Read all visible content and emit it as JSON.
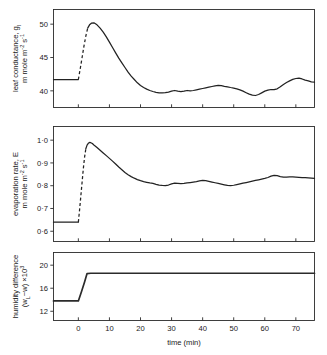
{
  "figure": {
    "xaxis": {
      "label_main": "time",
      "label_units": "(min)",
      "ticks": [
        "0",
        "10",
        "20",
        "30",
        "40",
        "50",
        "60",
        "70"
      ],
      "range": [
        -8,
        76
      ]
    },
    "panels": [
      {
        "name": "leaf-conductance",
        "ylabel_line1": "leaf conductance, g",
        "ylabel_line1_sub": "l",
        "ylabel_line2_a": "m mole m",
        "ylabel_line2_sup1": "-2",
        "ylabel_line2_b": " s",
        "ylabel_line2_sup2": "-1",
        "yticks": [
          "50",
          "45",
          "40"
        ]
      },
      {
        "name": "evaporation-rate",
        "ylabel_line1": "evaporation rate, E",
        "ylabel_line2_a": "m mole m",
        "ylabel_line2_sup1": "-2",
        "ylabel_line2_b": " s",
        "ylabel_line2_sup2": "-1",
        "yticks": [
          "1·0",
          "0·9",
          "0·8",
          "0·7",
          "0·6"
        ]
      },
      {
        "name": "humidity-difference",
        "ylabel_line1": "humidity difference",
        "ylabel_line2_a": "(w",
        "ylabel_line2_sub": "L",
        "ylabel_line2_b": "−w) ×10",
        "ylabel_line2_sup": "3",
        "yticks": [
          "20",
          "16",
          "12"
        ]
      }
    ]
  },
  "chart_data": [
    {
      "type": "line",
      "title": "",
      "name": "leaf conductance",
      "xlabel": "time (min)",
      "ylabel": "leaf conductance, g_l / m mole m^-2 s^-1",
      "xlim": [
        -8,
        76
      ],
      "ylim": [
        37.5,
        52.2
      ],
      "yticks": [
        40,
        45,
        50
      ],
      "xticks": [
        0,
        10,
        20,
        30,
        40,
        50,
        60,
        70
      ],
      "grid": false,
      "legend": null,
      "segments": [
        {
          "style": "solid",
          "x": [
            -8,
            -4,
            0
          ],
          "y": [
            41.7,
            41.7,
            41.7
          ]
        },
        {
          "style": "dashed",
          "x": [
            0,
            0.6,
            1.2,
            1.8,
            2.4,
            3.0
          ],
          "y": [
            41.7,
            43.3,
            45.0,
            46.7,
            48.2,
            49.4
          ]
        },
        {
          "style": "solid",
          "x": [
            3.0,
            3.6,
            4.2,
            5.0,
            6.0,
            7.0,
            8.0,
            9.0,
            10.0,
            11.0,
            12.0,
            13.0,
            14.0,
            15.0,
            16.0,
            17.0,
            18.0,
            19.0,
            20.0,
            21.0,
            22.0,
            23.0,
            24.0,
            25.0,
            26.0,
            27.0,
            28.0,
            29.0,
            30.0,
            31.0,
            32.0,
            33.0,
            34.0,
            35.0,
            36.0,
            37.0,
            38.0,
            39.0,
            40.0,
            41.0,
            42.0,
            43.0,
            44.0,
            45.0,
            46.0,
            47.0,
            48.0,
            49.0,
            50.0,
            51.0,
            52.0,
            53.0,
            54.0,
            55.0,
            56.0,
            57.0,
            58.0,
            59.0,
            60.0,
            61.0,
            62.0,
            63.0,
            64.0,
            65.0,
            66.0,
            67.0,
            68.0,
            69.0,
            70.0,
            71.0,
            72.0,
            73.0,
            74.0,
            75.0,
            76.0
          ],
          "y": [
            49.4,
            49.9,
            50.15,
            50.2,
            49.9,
            49.4,
            48.8,
            48.1,
            47.3,
            46.5,
            45.7,
            44.9,
            44.2,
            43.5,
            42.8,
            42.2,
            41.7,
            41.2,
            40.8,
            40.5,
            40.25,
            40.05,
            39.9,
            39.78,
            39.7,
            39.68,
            39.72,
            39.82,
            39.95,
            40.05,
            39.95,
            39.88,
            39.95,
            40.05,
            40.0,
            40.05,
            40.15,
            40.25,
            40.35,
            40.45,
            40.55,
            40.65,
            40.75,
            40.82,
            40.78,
            40.68,
            40.6,
            40.5,
            40.42,
            40.3,
            40.15,
            39.95,
            39.72,
            39.5,
            39.35,
            39.3,
            39.45,
            39.7,
            39.95,
            40.1,
            40.2,
            40.18,
            40.3,
            40.6,
            40.95,
            41.25,
            41.5,
            41.72,
            41.85,
            41.9,
            41.78,
            41.6,
            41.5,
            41.35,
            41.3
          ]
        }
      ]
    },
    {
      "type": "line",
      "title": "",
      "name": "evaporation rate",
      "xlabel": "time (min)",
      "ylabel": "evaporation rate, E / m mole m^-2 s^-1",
      "xlim": [
        -8,
        76
      ],
      "ylim": [
        0.555,
        1.06
      ],
      "yticks": [
        0.6,
        0.7,
        0.8,
        0.9,
        1.0
      ],
      "xticks": [
        0,
        10,
        20,
        30,
        40,
        50,
        60,
        70
      ],
      "grid": false,
      "legend": null,
      "segments": [
        {
          "style": "solid",
          "x": [
            -8,
            -4,
            0
          ],
          "y": [
            0.64,
            0.64,
            0.64
          ]
        },
        {
          "style": "dashed",
          "x": [
            0,
            0.4,
            0.8,
            1.2,
            1.6,
            2.0,
            2.4
          ],
          "y": [
            0.64,
            0.695,
            0.755,
            0.815,
            0.875,
            0.925,
            0.962
          ]
        },
        {
          "style": "solid",
          "x": [
            2.4,
            2.8,
            3.2,
            3.6,
            4.0,
            4.5,
            5.0,
            6.0,
            7.0,
            8.0,
            9.0,
            10.0,
            11.0,
            12.0,
            13.0,
            14.0,
            15.0,
            16.0,
            17.0,
            18.0,
            19.0,
            20.0,
            21.0,
            22.0,
            23.0,
            24.0,
            25.0,
            26.0,
            27.0,
            28.0,
            29.0,
            30.0,
            31.0,
            32.0,
            33.0,
            34.0,
            35.0,
            36.0,
            37.0,
            38.0,
            39.0,
            40.0,
            41.0,
            42.0,
            43.0,
            44.0,
            45.0,
            46.0,
            47.0,
            48.0,
            49.0,
            50.0,
            51.0,
            52.0,
            53.0,
            54.0,
            55.0,
            56.0,
            57.0,
            58.0,
            59.0,
            60.0,
            61.0,
            62.0,
            63.0,
            64.0,
            65.0,
            66.0,
            67.0,
            68.0,
            69.0,
            70.0,
            71.0,
            72.0,
            73.0,
            74.0,
            75.0,
            76.0
          ],
          "y": [
            0.962,
            0.978,
            0.986,
            0.99,
            0.989,
            0.985,
            0.979,
            0.968,
            0.956,
            0.944,
            0.932,
            0.92,
            0.908,
            0.895,
            0.882,
            0.87,
            0.858,
            0.848,
            0.84,
            0.833,
            0.827,
            0.822,
            0.818,
            0.815,
            0.812,
            0.81,
            0.806,
            0.803,
            0.801,
            0.8,
            0.803,
            0.808,
            0.811,
            0.81,
            0.809,
            0.81,
            0.812,
            0.814,
            0.816,
            0.818,
            0.821,
            0.823,
            0.822,
            0.819,
            0.816,
            0.813,
            0.81,
            0.807,
            0.804,
            0.801,
            0.8,
            0.802,
            0.805,
            0.808,
            0.811,
            0.814,
            0.817,
            0.82,
            0.823,
            0.826,
            0.829,
            0.832,
            0.836,
            0.842,
            0.845,
            0.844,
            0.84,
            0.838,
            0.838,
            0.839,
            0.839,
            0.838,
            0.837,
            0.836,
            0.835,
            0.834,
            0.833,
            0.832
          ]
        }
      ]
    },
    {
      "type": "line",
      "title": "",
      "name": "humidity difference",
      "xlabel": "time (min)",
      "ylabel": "humidity difference (w_L - w) x10^3",
      "xlim": [
        -8,
        76
      ],
      "ylim": [
        10.4,
        22.2
      ],
      "yticks": [
        12,
        16,
        20
      ],
      "xticks": [
        0,
        10,
        20,
        30,
        40,
        50,
        60,
        70
      ],
      "grid": false,
      "legend": null,
      "segments": [
        {
          "style": "thick",
          "x": [
            -8,
            -4,
            0,
            1.0,
            2.0,
            2.8,
            4.0,
            10.0,
            20.0,
            30.0,
            40.0,
            50.0,
            60.0,
            70.0,
            76.0
          ],
          "y": [
            13.8,
            13.8,
            13.8,
            15.4,
            17.1,
            18.55,
            18.6,
            18.6,
            18.6,
            18.6,
            18.6,
            18.6,
            18.6,
            18.6,
            18.6
          ]
        }
      ]
    }
  ]
}
